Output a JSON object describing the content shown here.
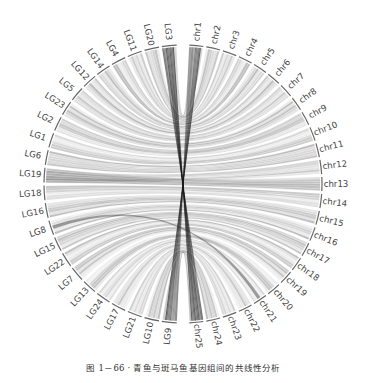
{
  "figure": {
    "type": "circos-synteny",
    "center": [
      183,
      184
    ],
    "radius": 139,
    "left_arc_label_prefix": "LG",
    "right_arc_label_prefix": "chr",
    "left_genome_labels": [
      "LG3",
      "LG20",
      "LG11",
      "LG4",
      "LG14",
      "LG12",
      "LG5",
      "LG23",
      "LG2",
      "LG1",
      "LG6",
      "LG19",
      "LG18",
      "LG16",
      "LG8",
      "LG15",
      "LG22",
      "LG7",
      "LG13",
      "LG24",
      "LG17",
      "LG21",
      "LG10",
      "LG9"
    ],
    "right_genome_labels": [
      "chr1",
      "chr2",
      "chr3",
      "chr4",
      "chr5",
      "chr6",
      "chr7",
      "chr8",
      "chr9",
      "chr10",
      "chr11",
      "chr12",
      "chr13",
      "chr14",
      "chr15",
      "chr16",
      "chr17",
      "chr18",
      "chr19",
      "chr20",
      "chr21",
      "chr22",
      "chr23",
      "chr24",
      "chr25"
    ],
    "ribbon_color": "#1a1a1a",
    "axis_color": "#666666"
  },
  "caption": {
    "text": "图 1－66 · 青鱼与斑马鱼基因组间的共线性分析"
  }
}
